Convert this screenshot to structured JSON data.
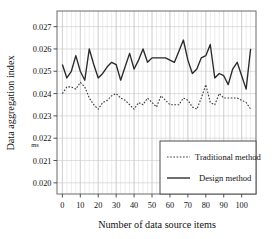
{
  "chart_data": {
    "type": "line",
    "title": "",
    "xlabel": "Number of data source items",
    "ylabel": "Data aggregation index",
    "yunit": "ms",
    "xlim": [
      -3,
      108
    ],
    "ylim": [
      0.0195,
      0.0277
    ],
    "xticks": [
      0,
      10,
      20,
      30,
      40,
      50,
      60,
      70,
      80,
      90,
      100
    ],
    "xticklabels": [
      "0",
      "10",
      "20",
      "30",
      "40",
      "50",
      "60",
      "70",
      "80",
      "90",
      "100"
    ],
    "yticks": [
      0.02,
      0.021,
      0.022,
      0.023,
      0.024,
      0.025,
      0.026,
      0.027
    ],
    "yticklabels": [
      "0.020",
      "0.021",
      "0.022",
      "0.023",
      "0.024",
      "0.025",
      "0.026",
      "0.027"
    ],
    "grid": true,
    "grid_minor_x": true,
    "legend_position": "lower right",
    "x": [
      0,
      2.5,
      5,
      7.5,
      10,
      12.5,
      15,
      17.5,
      20,
      22.5,
      25,
      27.5,
      30,
      32.5,
      35,
      37.5,
      40,
      42.5,
      45,
      47.5,
      50,
      52.5,
      55,
      57.5,
      60,
      62.5,
      65,
      67.5,
      70,
      72.5,
      75,
      77.5,
      80,
      82.5,
      85,
      87.5,
      90,
      92.5,
      95,
      97.5,
      100,
      102.5,
      105
    ],
    "series": [
      {
        "name": "Traditional method",
        "style": "dotted",
        "color": "#3b3b3b",
        "values": [
          0.024,
          0.0243,
          0.0243,
          0.0242,
          0.0245,
          0.0243,
          0.0238,
          0.0235,
          0.0233,
          0.0236,
          0.0237,
          0.0239,
          0.024,
          0.0238,
          0.0237,
          0.0235,
          0.0233,
          0.0236,
          0.0235,
          0.0238,
          0.0236,
          0.0234,
          0.0239,
          0.0237,
          0.0235,
          0.0235,
          0.0235,
          0.0238,
          0.0237,
          0.0234,
          0.0233,
          0.0238,
          0.0244,
          0.0236,
          0.0235,
          0.024,
          0.0238,
          0.0238,
          0.0238,
          0.0238,
          0.0237,
          0.0236,
          0.0233
        ]
      },
      {
        "name": "Design method",
        "style": "solid",
        "color": "#2a2a2a",
        "values": [
          0.0253,
          0.0247,
          0.025,
          0.0257,
          0.025,
          0.0246,
          0.026,
          0.0253,
          0.0247,
          0.0249,
          0.0252,
          0.0254,
          0.0253,
          0.0246,
          0.0252,
          0.0258,
          0.0251,
          0.0255,
          0.026,
          0.0254,
          0.0256,
          0.0256,
          0.0256,
          0.0256,
          0.0255,
          0.0254,
          0.0259,
          0.0264,
          0.0255,
          0.0249,
          0.0251,
          0.0256,
          0.0257,
          0.0262,
          0.0247,
          0.0249,
          0.0248,
          0.0244,
          0.0251,
          0.0254,
          0.0248,
          0.0242,
          0.026
        ]
      }
    ]
  },
  "axis": {
    "ylabel": "Data aggregation index",
    "xlabel": "Number of data source items",
    "unit": "ms"
  },
  "legend": {
    "items": [
      {
        "label": "Traditional method",
        "style": "dotted"
      },
      {
        "label": "Design method",
        "style": "solid"
      }
    ]
  }
}
